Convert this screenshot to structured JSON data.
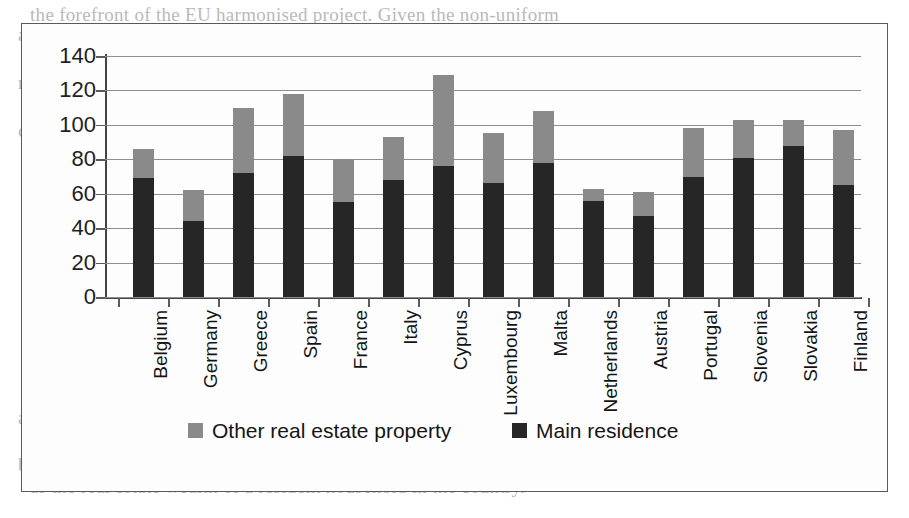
{
  "figure": {
    "frame_border_color": "#5a5a5a",
    "background_color": "#fdfdfd"
  },
  "legend": {
    "items": [
      {
        "label": "Other real estate property",
        "color": "#8a8a8a",
        "key": "other"
      },
      {
        "label": "Main residence",
        "color": "#262626",
        "key": "main"
      }
    ]
  },
  "page_bleed": {
    "lines": [
      "the forefront of the EU harmonised project. Given the non-uniform",
      "and non-full Census effort complexity, the pilots indicate and to",
      "Welfare findings of household real estate figures recognised",
      "non transparency based primarily on housing records that are directly",
      "resident. Moreover, it is noted that the sample of the representative",
      "countries in this report, most of the time, is the most relevant",
      "and the levels are broadly consistent and visible",
      "a stock of more accumulative in the course of assessment that a plot",
      "of property. The main issue on which measurement was done would reflect",
      "both the degrees and the amount of individual estates for assessment",
      "as the real estate wealth of a resident household in the country."
    ]
  },
  "chart_data": {
    "type": "bar",
    "subtype": "stacked-vertical",
    "title": "",
    "xlabel": "",
    "ylabel": "",
    "ylim": [
      0,
      140
    ],
    "ytick_step": 20,
    "yticks": [
      0,
      20,
      40,
      60,
      80,
      100,
      120,
      140
    ],
    "grid": true,
    "grid_axis": "y",
    "legend_position": "bottom",
    "categories": [
      "Belgium",
      "Germany",
      "Greece",
      "Spain",
      "France",
      "Italy",
      "Cyprus",
      "Luxembourg",
      "Malta",
      "Netherlands",
      "Austria",
      "Portugal",
      "Slovenia",
      "Slovakia",
      "Finland"
    ],
    "series": [
      {
        "name": "Main residence",
        "key": "main",
        "color": "#262626",
        "values": [
          69,
          44,
          72,
          82,
          55,
          68,
          76,
          66,
          78,
          56,
          47,
          70,
          81,
          88,
          65
        ]
      },
      {
        "name": "Other real estate property",
        "key": "other",
        "color": "#8a8a8a",
        "values": [
          17,
          18,
          38,
          36,
          25,
          25,
          53,
          29,
          30,
          7,
          14,
          28,
          22,
          15,
          32
        ]
      }
    ],
    "totals": [
      86,
      62,
      110,
      118,
      80,
      93,
      129,
      95,
      108,
      63,
      61,
      98,
      103,
      103,
      97
    ]
  }
}
